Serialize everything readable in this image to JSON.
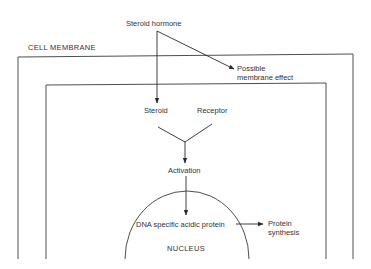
{
  "diagram": {
    "type": "steroid hormone mechanism of action",
    "nodes": {
      "hormone": "Steroid hormone",
      "membrane_label": "CELL MEMBRANE",
      "membrane_effect_line1": "Possible",
      "membrane_effect_line2": "membrane effect",
      "steroid": "Steroid",
      "receptor": "Receptor",
      "activation": "Activation",
      "dna_protein": "DNA specific acidic protein",
      "protein_synthesis_line1": "Protein",
      "protein_synthesis_line2": "synthesis",
      "nucleus": "NUCLEUS"
    },
    "edges": [
      {
        "from": "Steroid hormone",
        "to": "Steroid"
      },
      {
        "from": "Steroid hormone",
        "to": "Possible membrane effect"
      },
      {
        "from": "Steroid",
        "to": "Activation",
        "via": "Receptor"
      },
      {
        "from": "Activation",
        "to": "DNA specific acidic protein"
      },
      {
        "from": "DNA specific acidic protein",
        "to": "Protein synthesis"
      }
    ],
    "colors": {
      "line": "#3a3a3a",
      "background": "#ffffff"
    }
  }
}
